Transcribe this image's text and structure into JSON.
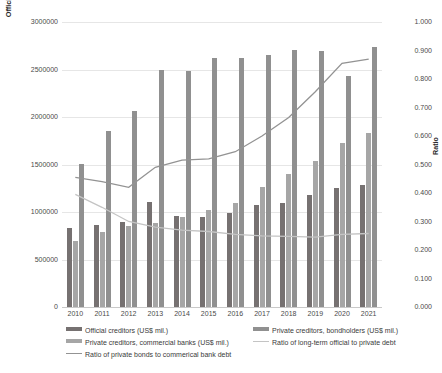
{
  "chart_data": {
    "type": "bar",
    "title": "",
    "subtitle": "",
    "xlabel": "",
    "ylabel": "Official and Private Stock of Long-term Debt (US$ mil.)",
    "y2label": "Ratio",
    "ylim": [
      0,
      3000000
    ],
    "y2lim": [
      0,
      1.0
    ],
    "grid": true,
    "legend_position": "bottom",
    "categories": [
      "2010",
      "2011",
      "2012",
      "2013",
      "2014",
      "2015",
      "2016",
      "2017",
      "2018",
      "2019",
      "2020",
      "2021"
    ],
    "y_ticks": [
      "0",
      "500000",
      "1000000",
      "1500000",
      "2000000",
      "2500000",
      "3000000"
    ],
    "y_tick_values": [
      0,
      500000,
      1000000,
      1500000,
      2000000,
      2500000,
      3000000
    ],
    "y2_ticks": [
      "0.000",
      "0.100",
      "0.200",
      "0.300",
      "0.400",
      "0.500",
      "0.600",
      "0.700",
      "0.800",
      "0.900",
      "1.000"
    ],
    "y2_tick_values": [
      0,
      0.1,
      0.2,
      0.3,
      0.4,
      0.5,
      0.6,
      0.7,
      0.8,
      0.9,
      1.0
    ],
    "series": [
      {
        "name": "Official creditors (US$ mil.)",
        "type": "bar",
        "axis": "left",
        "color": "#767171",
        "values": [
          830000,
          860000,
          900000,
          1110000,
          960000,
          950000,
          990000,
          1070000,
          1100000,
          1180000,
          1250000,
          1280000
        ]
      },
      {
        "name": "Private creditors, commercial banks  (US$ mil.)",
        "type": "bar",
        "axis": "left",
        "color": "#a6a6a6",
        "values": [
          700000,
          790000,
          850000,
          880000,
          950000,
          1020000,
          1090000,
          1260000,
          1400000,
          1540000,
          1730000,
          1830000
        ]
      },
      {
        "name": "Private creditors, bondholders (US$ mil.)",
        "type": "bar",
        "axis": "left",
        "color": "#909090",
        "values": [
          1510000,
          1850000,
          2060000,
          2490000,
          2480000,
          2620000,
          2620000,
          2650000,
          2710000,
          2690000,
          2430000,
          2740000
        ]
      },
      {
        "name": "Ratio of long-term official  to private debt",
        "type": "line",
        "axis": "right",
        "color": "#c4c4c4",
        "values": [
          0.395,
          0.35,
          0.3,
          0.28,
          0.27,
          0.265,
          0.255,
          0.25,
          0.248,
          0.245,
          0.255,
          0.258
        ]
      },
      {
        "name": "Ratio of private bonds to commerical bank debt",
        "type": "line",
        "axis": "right",
        "color": "#939393",
        "values": [
          0.455,
          0.44,
          0.42,
          0.49,
          0.515,
          0.52,
          0.545,
          0.6,
          0.665,
          0.755,
          0.855,
          0.87
        ]
      }
    ]
  },
  "legend": {
    "items": [
      {
        "label": "Official creditors (US$ mil.)",
        "marker": "swatch",
        "color": "#767171"
      },
      {
        "label": "Private creditors, bondholders (US$ mil.)",
        "marker": "swatch",
        "color": "#909090"
      },
      {
        "label": "Private creditors, commercial banks  (US$ mil.)",
        "marker": "swatch",
        "color": "#a6a6a6"
      },
      {
        "label": "Ratio of long-term official  to private debt",
        "marker": "line",
        "color": "#c4c4c4"
      },
      {
        "label": "Ratio of private bonds to commerical bank debt",
        "marker": "line",
        "color": "#939393"
      }
    ]
  }
}
